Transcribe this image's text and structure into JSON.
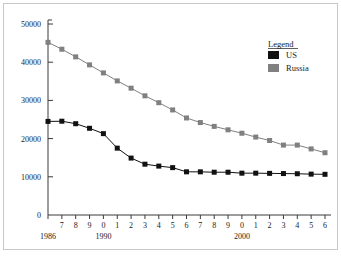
{
  "chart_data": {
    "type": "line",
    "title": "",
    "subtitle": "",
    "xlabel": "",
    "ylabel": "",
    "xlim": [
      1986,
      2006
    ],
    "ylim": [
      0,
      50000
    ],
    "grid": false,
    "legend": {
      "title": "Legend",
      "position": "top-right",
      "entries": [
        {
          "name": "US",
          "color": "#111111",
          "marker": "square"
        },
        {
          "name": "Russia",
          "color": "#808080",
          "marker": "square"
        }
      ]
    },
    "y_ticks": [
      0,
      10000,
      20000,
      30000,
      40000,
      50000
    ],
    "y_tick_labels": [
      "0",
      "10000",
      "20000",
      "30000",
      "40000",
      "50000"
    ],
    "x": [
      1986,
      1987,
      1988,
      1989,
      1990,
      1991,
      1992,
      1993,
      1994,
      1995,
      1996,
      1997,
      1998,
      1999,
      2000,
      2001,
      2002,
      2003,
      2004,
      2005,
      2006
    ],
    "x_tick_labels": [
      "6",
      "7",
      "8",
      "9",
      "0",
      "1",
      "2",
      "3",
      "4",
      "5",
      "6",
      "7",
      "8",
      "9",
      "0",
      "1",
      "2",
      "3",
      "4",
      "5",
      "6"
    ],
    "x_major_labels": [
      {
        "index": 0,
        "label": "1986"
      },
      {
        "index": 4,
        "label": "1990"
      },
      {
        "index": 14,
        "label": "2000"
      }
    ],
    "series": [
      {
        "name": "US",
        "color": "#111111",
        "values": [
          24500,
          24550,
          23900,
          22700,
          21300,
          17500,
          14900,
          13300,
          12800,
          12400,
          11300,
          11300,
          11200,
          11200,
          10950,
          10950,
          10900,
          10850,
          10800,
          10700,
          10650
        ]
      },
      {
        "name": "Russia",
        "color": "#808080",
        "values": [
          45200,
          43400,
          41400,
          39300,
          37200,
          35100,
          33200,
          31200,
          29400,
          27500,
          25400,
          24200,
          23200,
          22300,
          21400,
          20400,
          19500,
          18300,
          18300,
          17300,
          16300
        ]
      }
    ]
  },
  "geometry": {
    "plot_left": 48,
    "plot_right": 325,
    "plot_top": 24,
    "plot_bottom": 215
  }
}
